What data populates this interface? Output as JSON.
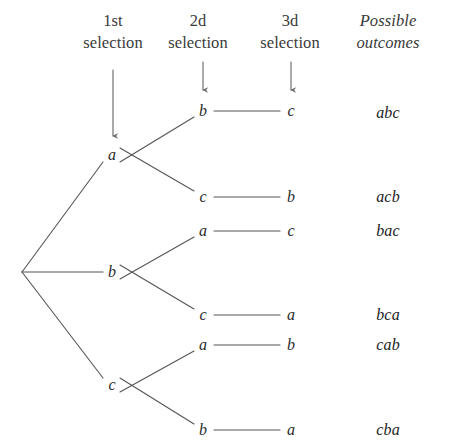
{
  "figure": {
    "background_color": "#ffffff",
    "line_color": "#555555",
    "text_color": "#2b2b2b"
  },
  "headers": [
    {
      "name": "first-selection",
      "text": "1st\nselection",
      "x": 113,
      "y": 10,
      "italic": false,
      "arrow": {
        "x": 113,
        "y1": 70,
        "y2": 136
      }
    },
    {
      "name": "second-selection",
      "text": "2d\nselection",
      "x": 198,
      "y": 10,
      "italic": false,
      "arrow": {
        "x": 203,
        "y1": 62,
        "y2": 90
      }
    },
    {
      "name": "third-selection",
      "text": "3d\nselection",
      "x": 290,
      "y": 10,
      "italic": false,
      "arrow": {
        "x": 291,
        "y1": 62,
        "y2": 90
      }
    },
    {
      "name": "possible-outcomes",
      "text": "Possible\noutcomes",
      "x": 388,
      "y": 10,
      "italic": true,
      "arrow": null
    }
  ],
  "root": {
    "name": "tree-root",
    "x": 22,
    "y": 272
  },
  "level1_nodes": [
    {
      "name": "node-level1-a",
      "label": "a",
      "x": 112,
      "y": 155
    },
    {
      "name": "node-level1-b",
      "label": "b",
      "x": 112,
      "y": 272
    },
    {
      "name": "node-level1-c",
      "label": "c",
      "x": 112,
      "y": 385
    }
  ],
  "level2_nodes": [
    {
      "name": "node-level2-ab",
      "label": "b",
      "x": 203,
      "y": 111,
      "parent": 0
    },
    {
      "name": "node-level2-ac",
      "label": "c",
      "x": 203,
      "y": 197,
      "parent": 0
    },
    {
      "name": "node-level2-ba",
      "label": "a",
      "x": 203,
      "y": 231,
      "parent": 1
    },
    {
      "name": "node-level2-bc",
      "label": "c",
      "x": 203,
      "y": 315,
      "parent": 1
    },
    {
      "name": "node-level2-ca",
      "label": "a",
      "x": 203,
      "y": 345,
      "parent": 2
    },
    {
      "name": "node-level2-cb",
      "label": "b",
      "x": 203,
      "y": 430,
      "parent": 2
    }
  ],
  "level3_nodes": [
    {
      "name": "node-level3-abc",
      "label": "c",
      "x": 291,
      "y": 111,
      "parent": 0
    },
    {
      "name": "node-level3-acb",
      "label": "b",
      "x": 291,
      "y": 197,
      "parent": 1
    },
    {
      "name": "node-level3-bac",
      "label": "c",
      "x": 291,
      "y": 231,
      "parent": 2
    },
    {
      "name": "node-level3-bca",
      "label": "a",
      "x": 291,
      "y": 315,
      "parent": 3
    },
    {
      "name": "node-level3-cab",
      "label": "b",
      "x": 291,
      "y": 345,
      "parent": 4
    },
    {
      "name": "node-level3-cba",
      "label": "a",
      "x": 291,
      "y": 430,
      "parent": 5
    }
  ],
  "outcomes": [
    {
      "name": "outcome-abc",
      "label": "abc",
      "x": 388,
      "y": 113
    },
    {
      "name": "outcome-acb",
      "label": "acb",
      "x": 388,
      "y": 197
    },
    {
      "name": "outcome-bac",
      "label": "bac",
      "x": 388,
      "y": 231
    },
    {
      "name": "outcome-bca",
      "label": "bca",
      "x": 388,
      "y": 315
    },
    {
      "name": "outcome-cab",
      "label": "cab",
      "x": 388,
      "y": 345
    },
    {
      "name": "outcome-cba",
      "label": "cba",
      "x": 388,
      "y": 430
    }
  ]
}
